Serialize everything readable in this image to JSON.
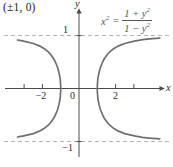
{
  "figure": {
    "corner_label": "(±1, 0)",
    "equation": {
      "lhs_var": "x",
      "lhs_sup": "2",
      "equals": "=",
      "num_pre": "1 + ",
      "num_var": "y",
      "num_sup": "2",
      "den_pre": "1 − ",
      "den_var": "y",
      "den_sup": "2"
    },
    "axis_labels": {
      "x": "x",
      "y": "y"
    },
    "tick_labels": {
      "x_minus_2": "−2",
      "x_zero": "0",
      "x_two": "2",
      "y_one": "1",
      "y_minus_one": "−1"
    }
  },
  "chart_data": {
    "type": "line",
    "title": "",
    "equation_text": "x² = (1 + y²)/(1 − y²)",
    "annotation": "(±1, 0)",
    "x_intercepts": [
      [
        -1,
        0
      ],
      [
        1,
        0
      ]
    ],
    "asymptotes_y": [
      1,
      -1
    ],
    "x_tick_marks": [
      -3,
      -2,
      2,
      3
    ],
    "x_tick_labels": [
      {
        "value": -2,
        "label": "−2"
      },
      {
        "value": 0,
        "label": "0"
      },
      {
        "value": 2,
        "label": "2"
      }
    ],
    "y_tick_labels": [
      {
        "value": 1,
        "label": "1"
      },
      {
        "value": -1,
        "label": "−1"
      }
    ],
    "xlim": [
      -4.1,
      4.7
    ],
    "ylim": [
      -1.5,
      1.55
    ],
    "grid": false,
    "legend": false,
    "series": [
      {
        "name": "right-branch",
        "points": [
          [
            4.4173,
            -0.95
          ],
          [
            4.0227,
            -0.94
          ],
          [
            3.7152,
            -0.93
          ],
          [
            3.4671,
            -0.92
          ],
          [
            3.261,
            -0.91
          ],
          [
            3.0865,
            -0.9
          ],
          [
            2.4914,
            -0.85
          ],
          [
            2.1344,
            -0.8
          ],
          [
            1.8898,
            -0.75
          ],
          [
            1.7093,
            -0.7
          ],
          [
            1.5694,
            -0.65
          ],
          [
            1.4577,
            -0.6
          ],
          [
            1.3665,
            -0.55
          ],
          [
            1.291,
            -0.5
          ],
          [
            1.2279,
            -0.45
          ],
          [
            1.1751,
            -0.4
          ],
          [
            1.131,
            -0.35
          ],
          [
            1.0944,
            -0.3
          ],
          [
            1.0646,
            -0.25
          ],
          [
            1.0408,
            -0.2
          ],
          [
            1.0228,
            -0.15
          ],
          [
            1.0101,
            -0.1
          ],
          [
            1.0025,
            -0.05
          ],
          [
            1.0,
            0
          ],
          [
            1.0025,
            0.05
          ],
          [
            1.0101,
            0.1
          ],
          [
            1.0228,
            0.15
          ],
          [
            1.0408,
            0.2
          ],
          [
            1.0646,
            0.25
          ],
          [
            1.0944,
            0.3
          ],
          [
            1.131,
            0.35
          ],
          [
            1.1751,
            0.4
          ],
          [
            1.2279,
            0.45
          ],
          [
            1.291,
            0.5
          ],
          [
            1.3665,
            0.55
          ],
          [
            1.4577,
            0.6
          ],
          [
            1.5694,
            0.65
          ],
          [
            1.7093,
            0.7
          ],
          [
            1.8898,
            0.75
          ],
          [
            2.1344,
            0.8
          ],
          [
            2.4914,
            0.85
          ],
          [
            3.0865,
            0.9
          ],
          [
            3.261,
            0.91
          ],
          [
            3.4671,
            0.92
          ],
          [
            3.7152,
            0.93
          ],
          [
            4.0227,
            0.94
          ],
          [
            4.4173,
            0.95
          ]
        ]
      },
      {
        "name": "left-branch",
        "points": [
          [
            -3.3596,
            -0.915
          ],
          [
            -3.261,
            -0.91
          ],
          [
            -3.0865,
            -0.9
          ],
          [
            -2.4914,
            -0.85
          ],
          [
            -2.1344,
            -0.8
          ],
          [
            -1.8898,
            -0.75
          ],
          [
            -1.7093,
            -0.7
          ],
          [
            -1.5694,
            -0.65
          ],
          [
            -1.4577,
            -0.6
          ],
          [
            -1.3665,
            -0.55
          ],
          [
            -1.291,
            -0.5
          ],
          [
            -1.2279,
            -0.45
          ],
          [
            -1.1751,
            -0.4
          ],
          [
            -1.131,
            -0.35
          ],
          [
            -1.0944,
            -0.3
          ],
          [
            -1.0646,
            -0.25
          ],
          [
            -1.0408,
            -0.2
          ],
          [
            -1.0228,
            -0.15
          ],
          [
            -1.0101,
            -0.1
          ],
          [
            -1.0025,
            -0.05
          ],
          [
            -1.0,
            0
          ],
          [
            -1.0025,
            0.05
          ],
          [
            -1.0101,
            0.1
          ],
          [
            -1.0228,
            0.15
          ],
          [
            -1.0408,
            0.2
          ],
          [
            -1.0646,
            0.25
          ],
          [
            -1.0944,
            0.3
          ],
          [
            -1.131,
            0.35
          ],
          [
            -1.1751,
            0.4
          ],
          [
            -1.2279,
            0.45
          ],
          [
            -1.291,
            0.5
          ],
          [
            -1.3665,
            0.55
          ],
          [
            -1.4577,
            0.6
          ],
          [
            -1.5694,
            0.65
          ],
          [
            -1.7093,
            0.7
          ],
          [
            -1.8898,
            0.75
          ],
          [
            -2.1344,
            0.8
          ],
          [
            -2.4914,
            0.85
          ],
          [
            -3.0865,
            0.9
          ],
          [
            -3.261,
            0.91
          ],
          [
            -3.3596,
            0.915
          ]
        ]
      }
    ]
  },
  "colors": {
    "curve": "#6f6f6f",
    "asymptote": "#b5b5b5",
    "axis": "#4b4b4b",
    "text": "#2a2a2a",
    "equation_text": "#555555",
    "background": "#ffffff"
  }
}
